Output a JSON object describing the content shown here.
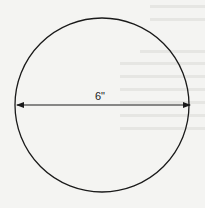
{
  "diagram": {
    "shape": "circle",
    "dimension_label": "6\"",
    "dimension": "diameter",
    "colors": {
      "stroke": "#1a1a1a",
      "background": "#f4f4f2"
    }
  }
}
